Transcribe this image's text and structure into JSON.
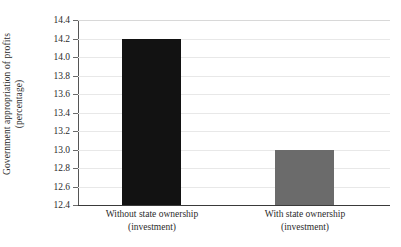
{
  "chart_data": {
    "type": "bar",
    "title": "",
    "xlabel": "",
    "ylabel": "Government appropriation of profits (percentage)",
    "ylabel_line1": "Government appropriation of profits",
    "ylabel_line2": "(percentage)",
    "categories": [
      "Without state ownership (investment)",
      "With state ownership (investment)"
    ],
    "category_lines": [
      {
        "main": "Without state ownership",
        "sub": "(investment)"
      },
      {
        "main": "With state ownership",
        "sub": "(investment)"
      }
    ],
    "values": [
      14.19,
      13.0
    ],
    "ylim": [
      12.4,
      14.4
    ],
    "ytick_step": 0.2,
    "ytick_labels": [
      "14.4",
      "14.2",
      "14.0",
      "13.8",
      "13.6",
      "13.4",
      "13.2",
      "13.0",
      "12.8",
      "12.6",
      "12.4"
    ],
    "ytick_values": [
      14.4,
      14.2,
      14.0,
      13.8,
      13.6,
      13.4,
      13.2,
      13.0,
      12.8,
      12.6,
      12.4
    ],
    "grid": true,
    "legend": "none",
    "bar_colors": [
      "#121212",
      "#6b6b6b"
    ],
    "gridline_color": "#e8e8e8",
    "axis_color": "#3a3a3a",
    "background_color": "#ffffff",
    "text_color": "#2b2b2b"
  }
}
